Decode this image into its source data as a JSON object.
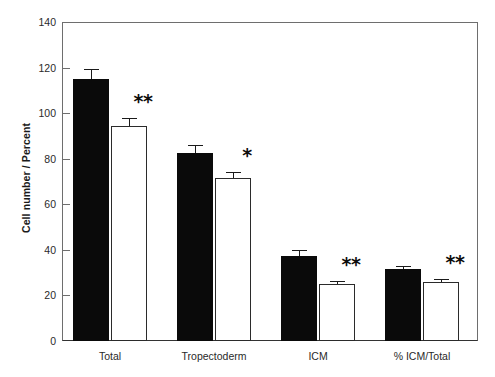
{
  "chart_data": {
    "type": "bar",
    "title": "",
    "xlabel": "",
    "ylabel": "Cell number / Percent",
    "ylim": [
      0,
      140
    ],
    "yticks": [
      0,
      20,
      40,
      60,
      80,
      100,
      120,
      140
    ],
    "ytick_labels": [
      "0",
      "20",
      "40",
      "60",
      "80",
      "100",
      "120",
      "140"
    ],
    "grid": false,
    "legend": null,
    "categories": [
      "Total",
      "Tropectoderm",
      "ICM",
      "% ICM/Total"
    ],
    "series": [
      {
        "name": "black",
        "fill": "#0a0a0a",
        "values": [
          115,
          82.5,
          37.5,
          31.5
        ],
        "errors": [
          4.5,
          3.5,
          2.5,
          1.2
        ]
      },
      {
        "name": "white",
        "fill": "#ffffff",
        "values": [
          94.5,
          71.5,
          25,
          26
        ],
        "errors": [
          3.5,
          2.5,
          1.2,
          1.0
        ]
      }
    ],
    "annotations": [
      {
        "category": "Total",
        "text": "**"
      },
      {
        "category": "Tropectoderm",
        "text": "*"
      },
      {
        "category": "ICM",
        "text": "**"
      },
      {
        "category": "% ICM/Total",
        "text": "**"
      }
    ]
  },
  "colors": {
    "axis": "#6e6e6e",
    "text": "#2a2a2a",
    "bar_black": "#0a0a0a",
    "bar_white": "#ffffff",
    "bar_outline": "#2b2b2b"
  }
}
